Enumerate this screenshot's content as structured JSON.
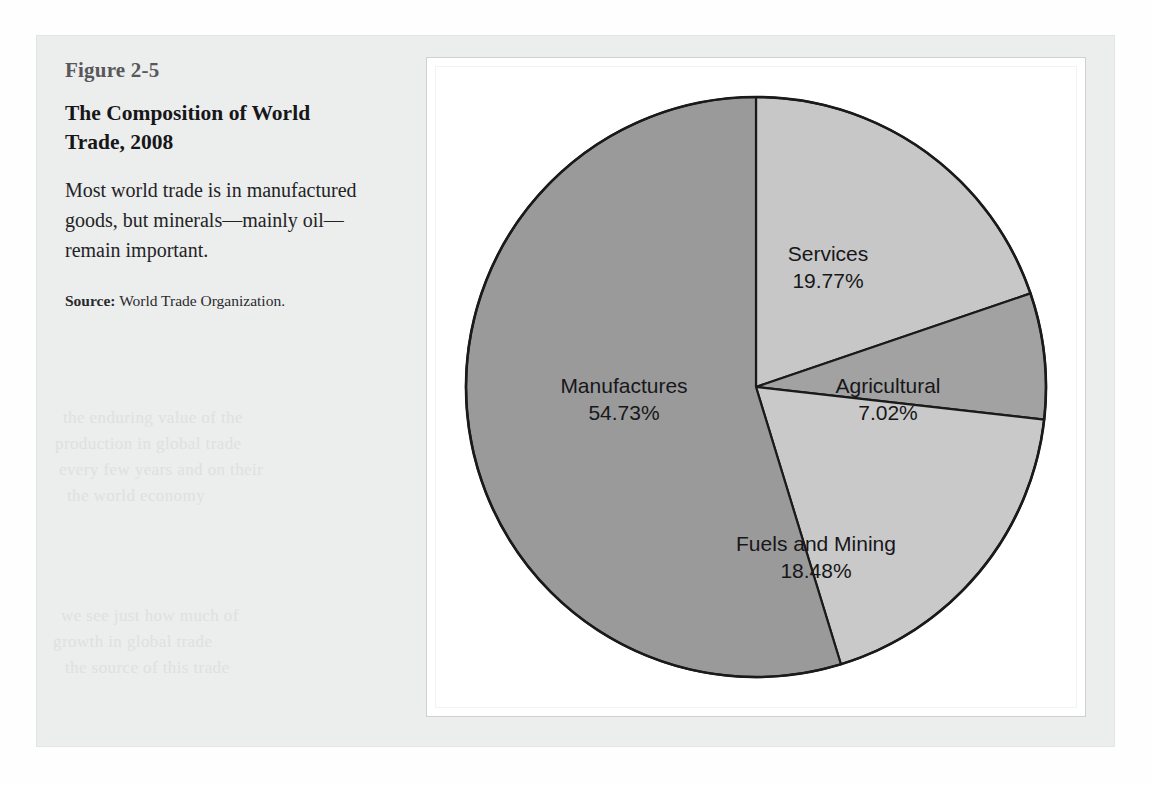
{
  "figure": {
    "number": "Figure 2-5",
    "title": "The Composition of World Trade, 2008",
    "description": "Most world trade is in manufactured goods, but minerals—mainly oil—remain important.",
    "source_label": "Source:",
    "source_text": "World Trade Organization."
  },
  "colors": {
    "panel_background": "#eceded",
    "chart_background": "#ffffff",
    "outline": "#1a1a1a",
    "services": "#c7c7c7",
    "agricultural": "#a2a2a2",
    "fuels_and_mining": "#c9c9c9",
    "manufactures": "#9a9a9a"
  },
  "chart_data": {
    "type": "pie",
    "title": "The Composition of World Trade, 2008",
    "subtitle": "",
    "xlabel": "",
    "ylabel": "",
    "units": "percent",
    "start_angle_deg": 0,
    "direction": "clockwise",
    "grid": false,
    "legend": "none",
    "labels_inside": true,
    "total": 100.0,
    "categories": [
      "Services",
      "Agricultural",
      "Fuels and Mining",
      "Manufactures"
    ],
    "values": [
      19.77,
      7.02,
      18.48,
      54.73
    ],
    "slices": [
      {
        "name": "Services",
        "value": 19.77,
        "value_text": "19.77%",
        "color": "#c7c7c7",
        "label_x": 372,
        "label_y": 160,
        "label_anchor": "middle"
      },
      {
        "name": "Agricultural",
        "value": 7.02,
        "value_text": "7.02%",
        "color": "#a2a2a2",
        "label_x": 432,
        "label_y": 292,
        "label_anchor": "middle"
      },
      {
        "name": "Fuels and Mining",
        "value": 18.48,
        "value_text": "18.48%",
        "color": "#c9c9c9",
        "label_x": 360,
        "label_y": 450,
        "label_anchor": "middle"
      },
      {
        "name": "Manufactures",
        "value": 54.73,
        "value_text": "54.73%",
        "color": "#9a9a9a",
        "label_x": 168,
        "label_y": 292,
        "label_anchor": "middle"
      }
    ]
  },
  "ghost_text": {
    "line1": "the enduring value of the",
    "line2": "production in global trade",
    "line3": "every few years and on their",
    "line4": "the world economy",
    "line5": "we see just how much of",
    "line6": "growth in global trade",
    "line7": "the source of this trade"
  }
}
